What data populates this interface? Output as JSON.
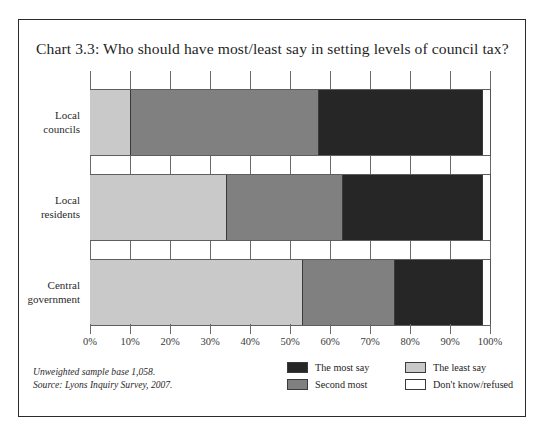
{
  "figure": {
    "title": "Chart 3.3: Who should have most/least say in setting levels of council tax?",
    "footnote_line1": "Unweighted sample base 1,058.",
    "footnote_line2": "Source: Lyons Inquiry Survey, 2007."
  },
  "colors": {
    "most_say": "#262626",
    "second_most": "#808080",
    "least_say": "#c9c9c9",
    "dont_know": "#ffffff",
    "axis": "#6a6a6a",
    "frame": "#2b2b2b",
    "text": "#1f1f1f"
  },
  "legend": {
    "position": "bottom-right",
    "items": [
      {
        "label": "The most say",
        "color": "#262626"
      },
      {
        "label": "Second most",
        "color": "#808080"
      },
      {
        "label": "The least say",
        "color": "#c9c9c9"
      },
      {
        "label": "Don't know/refused",
        "color": "#ffffff"
      }
    ]
  },
  "chart_data": {
    "type": "bar",
    "orientation": "horizontal",
    "stacked": true,
    "title": "Chart 3.3: Who should have most/least say in setting levels of council tax?",
    "xlabel": "",
    "ylabel": "",
    "xlim": [
      0,
      100
    ],
    "xtick_labels": [
      "0%",
      "10%",
      "20%",
      "30%",
      "40%",
      "50%",
      "60%",
      "70%",
      "80%",
      "90%",
      "100%"
    ],
    "xtick_values": [
      0,
      10,
      20,
      30,
      40,
      50,
      60,
      70,
      80,
      90,
      100
    ],
    "grid": false,
    "legend_position": "bottom-right",
    "categories": [
      "Local councils",
      "Local residents",
      "Central government"
    ],
    "category_lines": [
      [
        "Local",
        "councils"
      ],
      [
        "Local",
        "residents"
      ],
      [
        "Central",
        "government"
      ]
    ],
    "stack_order": [
      "The least say",
      "Second most",
      "The most say",
      "Don't know/refused"
    ],
    "series": [
      {
        "name": "The least say",
        "color": "#c9c9c9",
        "values": [
          10,
          34,
          53
        ]
      },
      {
        "name": "Second most",
        "color": "#808080",
        "values": [
          47,
          29,
          23
        ]
      },
      {
        "name": "The most say",
        "color": "#262626",
        "values": [
          41,
          35,
          22
        ]
      },
      {
        "name": "Don't know/refused",
        "color": "#ffffff",
        "values": [
          2,
          2,
          2
        ]
      }
    ],
    "bars": [
      {
        "category": "Local councils",
        "segments": [
          {
            "name": "The least say",
            "value": 10,
            "start": 0,
            "end": 10,
            "color": "#c9c9c9"
          },
          {
            "name": "Second most",
            "value": 47,
            "start": 10,
            "end": 57,
            "color": "#808080"
          },
          {
            "name": "The most say",
            "value": 41,
            "start": 57,
            "end": 98,
            "color": "#262626"
          },
          {
            "name": "Don't know/refused",
            "value": 2,
            "start": 98,
            "end": 100,
            "color": "#ffffff"
          }
        ]
      },
      {
        "category": "Local residents",
        "segments": [
          {
            "name": "The least say",
            "value": 34,
            "start": 0,
            "end": 34,
            "color": "#c9c9c9"
          },
          {
            "name": "Second most",
            "value": 29,
            "start": 34,
            "end": 63,
            "color": "#808080"
          },
          {
            "name": "The most say",
            "value": 35,
            "start": 63,
            "end": 98,
            "color": "#262626"
          },
          {
            "name": "Don't know/refused",
            "value": 2,
            "start": 98,
            "end": 100,
            "color": "#ffffff"
          }
        ]
      },
      {
        "category": "Central government",
        "segments": [
          {
            "name": "The least say",
            "value": 53,
            "start": 0,
            "end": 53,
            "color": "#c9c9c9"
          },
          {
            "name": "Second most",
            "value": 23,
            "start": 53,
            "end": 76,
            "color": "#808080"
          },
          {
            "name": "The most say",
            "value": 22,
            "start": 76,
            "end": 98,
            "color": "#262626"
          },
          {
            "name": "Don't know/refused",
            "value": 2,
            "start": 98,
            "end": 100,
            "color": "#ffffff"
          }
        ]
      }
    ]
  }
}
